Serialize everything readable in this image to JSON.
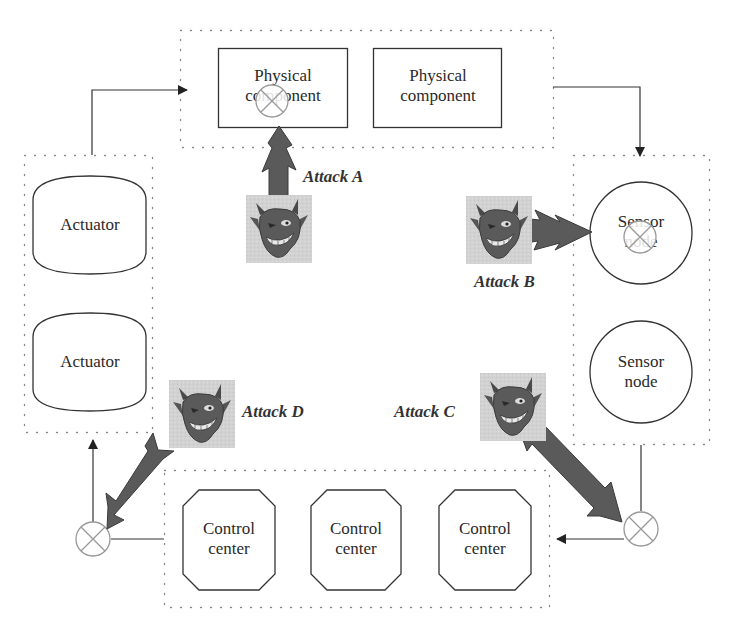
{
  "diagram": {
    "type": "cyber-physical system attack model",
    "colors": {
      "background": "#ffffff",
      "line": "#333333",
      "dotted_border": "#888888",
      "attack_arrow": "#5a5a5a",
      "devil_background": "#d4d4d4",
      "devil_face": "#555555",
      "xor_symbol": "#999999"
    },
    "groups": {
      "physical": {
        "components": [
          {
            "label": "Physical component",
            "label_visible": "Physical co   nent",
            "compromised": true
          },
          {
            "label": "Physical component",
            "compromised": false
          }
        ]
      },
      "actuators": {
        "items": [
          {
            "label": "Actuator"
          },
          {
            "label": "Actuator"
          }
        ]
      },
      "sensors": {
        "items": [
          {
            "label_line1": "Sensor",
            "label_line2": "node",
            "compromised": true
          },
          {
            "label_line1": "Sensor",
            "label_line2": "node",
            "compromised": false
          }
        ]
      },
      "control": {
        "items": [
          {
            "label_line1": "Control",
            "label_line2": "center"
          },
          {
            "label_line1": "Control",
            "label_line2": "center"
          },
          {
            "label_line1": "Control",
            "label_line2": "center"
          }
        ]
      }
    },
    "attacks": [
      {
        "id": "A",
        "label": "Attack A",
        "target": "Physical component",
        "icon": "devil-icon"
      },
      {
        "id": "B",
        "label": "Attack B",
        "target": "Sensor node",
        "icon": "devil-icon"
      },
      {
        "id": "C",
        "label": "Attack C",
        "target": "Sensor-to-control link",
        "icon": "devil-icon"
      },
      {
        "id": "D",
        "label": "Attack D",
        "target": "Control-to-actuator link",
        "icon": "devil-icon"
      }
    ],
    "flow": [
      "Actuator",
      "Physical component",
      "Sensor node",
      "Control center",
      "Actuator"
    ]
  }
}
